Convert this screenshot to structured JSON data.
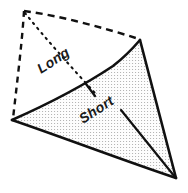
{
  "figure": {
    "name": "curved-triangle-geodesic-diagram",
    "background_color": "#ffffff",
    "stroke_color": "#111111",
    "fill_pattern_color": "#3a3a3a",
    "fill_background_color": "#fdfdfd"
  },
  "labels": {
    "long": "Long",
    "short": "Short"
  },
  "geometry": {
    "apex": {
      "x": 24,
      "y": 11
    },
    "left_vertex": {
      "x": 12,
      "y": 120
    },
    "top_right_vertex": {
      "x": 140,
      "y": 40
    },
    "bottom_right_vertex": {
      "x": 176,
      "y": 178
    },
    "curve_midpoint": {
      "x": 95,
      "y": 95
    },
    "long_leader_end": {
      "x": 95,
      "y": 93
    },
    "short_leader_start": {
      "x": 88,
      "y": 88
    },
    "short_leader_end": {
      "x": 176,
      "y": 178
    }
  },
  "label_rotation": {
    "long_deg": -33,
    "short_deg": -33
  }
}
